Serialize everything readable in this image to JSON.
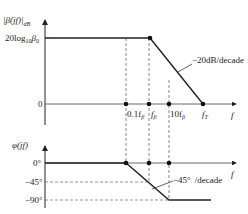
{
  "magnitude_plot": {
    "ylabel": "|β̇(jf)|dB",
    "ylabel_main": "|β̇(jf)|",
    "ylabel_sub": "dB",
    "y_level_label": "20log",
    "y_level_sub": "10",
    "y_level_var": "β",
    "y_level_var_sub": "0",
    "zero_label": "0",
    "xlabel": "f",
    "x_ticks": [
      "0.1fβ",
      "fβ",
      "10fβ",
      "fT"
    ],
    "tick_01": "0.1f",
    "tick_01_sub": "β",
    "tick_fb": "f",
    "tick_fb_sub": "β",
    "tick_10": "10f",
    "tick_10_sub": "β",
    "tick_fT": "f",
    "tick_fT_sub": "T",
    "slope_annotation": "−20dB/decade"
  },
  "phase_plot": {
    "ylabel": "φ(jf)",
    "y_ticks": [
      "0°",
      "−45°",
      "−90°"
    ],
    "tick_0": "0°",
    "tick_45": "−45°",
    "tick_90": "−90°",
    "xlabel": "f",
    "slope_annotation_value": "−45°",
    "slope_annotation_unit": "/decade"
  }
}
